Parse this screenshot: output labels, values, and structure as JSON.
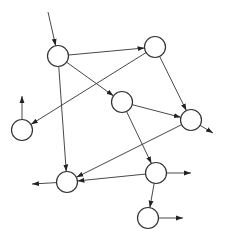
{
  "diagram": {
    "type": "directed-graph",
    "node_labels_visible": false,
    "colors": {
      "stroke": "#333333",
      "node_fill": "#ffffff",
      "background": "#ffffff"
    },
    "nodes": [
      {
        "id": "n1"
      },
      {
        "id": "n2"
      },
      {
        "id": "n3"
      },
      {
        "id": "n4"
      },
      {
        "id": "n5"
      },
      {
        "id": "n6"
      },
      {
        "id": "n7"
      },
      {
        "id": "n8"
      }
    ],
    "edges": [
      {
        "from": "in",
        "to": "n1"
      },
      {
        "from": "n1",
        "to": "n2"
      },
      {
        "from": "n1",
        "to": "n3"
      },
      {
        "from": "n1",
        "to": "n6"
      },
      {
        "from": "n2",
        "to": "n5"
      },
      {
        "from": "n2",
        "to": "n4"
      },
      {
        "from": "n3",
        "to": "n4"
      },
      {
        "from": "n3",
        "to": "n7"
      },
      {
        "from": "n4",
        "to": "n6"
      },
      {
        "from": "n4",
        "to": "out"
      },
      {
        "from": "n5",
        "to": "out"
      },
      {
        "from": "n6",
        "to": "out"
      },
      {
        "from": "n7",
        "to": "n6"
      },
      {
        "from": "n7",
        "to": "n8"
      },
      {
        "from": "n7",
        "to": "out"
      },
      {
        "from": "n8",
        "to": "out"
      }
    ]
  }
}
